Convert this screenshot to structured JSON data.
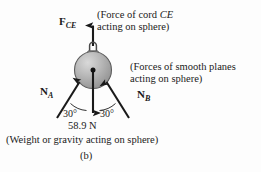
{
  "figure": {
    "part_caption": "(b)",
    "background_color": "#fdfdfd",
    "ink_color": "#1a1a1a",
    "sphere_fill": "#a8a8a8",
    "sphere_highlight": "#d8d8d8"
  },
  "annotations": {
    "cord": {
      "line1_prefix": "(Force of cord ",
      "line1_italic": "CE",
      "line2": "acting on sphere)"
    },
    "planes": {
      "line1": "(Forces of smooth planes",
      "line2": "acting on sphere)"
    },
    "weight": {
      "line1": "(Weight or gravity acting on sphere)"
    }
  },
  "vectors": {
    "cord_force": {
      "name": "F",
      "subscript": "CE",
      "direction": "up"
    },
    "normal_a": {
      "name": "N",
      "subscript": "A",
      "direction": "up-right"
    },
    "normal_b": {
      "name": "N",
      "subscript": "B",
      "direction": "up-left"
    },
    "weight": {
      "value": "58.9 N",
      "direction": "down"
    }
  },
  "angles": {
    "left": "30°",
    "right": "30°"
  },
  "icons": {
    "sphere": "sphere-icon",
    "eyelet": "eyelet-ring-icon",
    "center_dot": "center-point-icon",
    "arrow_up": "arrow-up-icon",
    "arrow_down": "arrow-down-icon",
    "arrow_diag_left": "arrow-up-right-icon",
    "arrow_diag_right": "arrow-up-left-icon",
    "arc_left": "angle-arc-icon",
    "arc_right": "angle-arc-icon"
  }
}
